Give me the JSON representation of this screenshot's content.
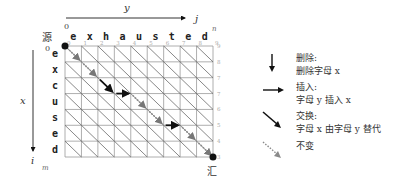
{
  "diagram": {
    "axis_y_label": "y",
    "axis_j_label": "j",
    "axis_n_label": "n",
    "axis_x_label": "x",
    "axis_i_label": "i",
    "axis_m_label": "m",
    "origin_col_label": "0",
    "origin_row_label": "0",
    "source_label": "源",
    "sink_label": "汇",
    "column_letters": [
      "e",
      "x",
      "h",
      "a",
      "u",
      "s",
      "t",
      "e",
      "d"
    ],
    "row_letters": [
      "e",
      "x",
      "c",
      "u",
      "s",
      "e",
      "d"
    ],
    "top_numbers": [
      "0",
      "1",
      "2",
      "3",
      "4",
      "5",
      "6",
      "7",
      "8",
      "9"
    ],
    "right_numbers": [
      "9",
      "8",
      "7",
      "7",
      "6",
      "5",
      "4",
      "3"
    ],
    "path": [
      {
        "from": [
          0,
          0
        ],
        "to": [
          1,
          1
        ],
        "type": "unchanged"
      },
      {
        "from": [
          1,
          1
        ],
        "to": [
          2,
          2
        ],
        "type": "unchanged"
      },
      {
        "from": [
          2,
          2
        ],
        "to": [
          3,
          3
        ],
        "type": "substitute"
      },
      {
        "from": [
          3,
          3
        ],
        "to": [
          3,
          4
        ],
        "type": "insert"
      },
      {
        "from": [
          3,
          4
        ],
        "to": [
          4,
          5
        ],
        "type": "unchanged"
      },
      {
        "from": [
          4,
          5
        ],
        "to": [
          5,
          6
        ],
        "type": "unchanged"
      },
      {
        "from": [
          5,
          6
        ],
        "to": [
          5,
          7
        ],
        "type": "insert"
      },
      {
        "from": [
          5,
          7
        ],
        "to": [
          6,
          8
        ],
        "type": "unchanged"
      },
      {
        "from": [
          6,
          8
        ],
        "to": [
          7,
          9
        ],
        "type": "unchanged"
      }
    ]
  },
  "legend": {
    "items": [
      {
        "type": "delete",
        "icon": "down-arrow-icon",
        "title": "删除:",
        "desc": "删除字母 x"
      },
      {
        "type": "insert",
        "icon": "right-arrow-icon",
        "title": "插入:",
        "desc": "字母 y 插入 x"
      },
      {
        "type": "substitute",
        "icon": "diagonal-arrow-icon",
        "title": "交换:",
        "desc": "字母 x 由字母 y 替代"
      },
      {
        "type": "unchanged",
        "icon": "dotted-diagonal-arrow-icon",
        "title": "不变",
        "desc": ""
      }
    ]
  },
  "colors": {
    "grid": "#9a9a9a",
    "diagonal": "#555555",
    "path_solid": "#111111",
    "path_dotted": "#8a8a8a",
    "node": "#111111",
    "text": "#333333",
    "number": "#aaaaaa"
  }
}
